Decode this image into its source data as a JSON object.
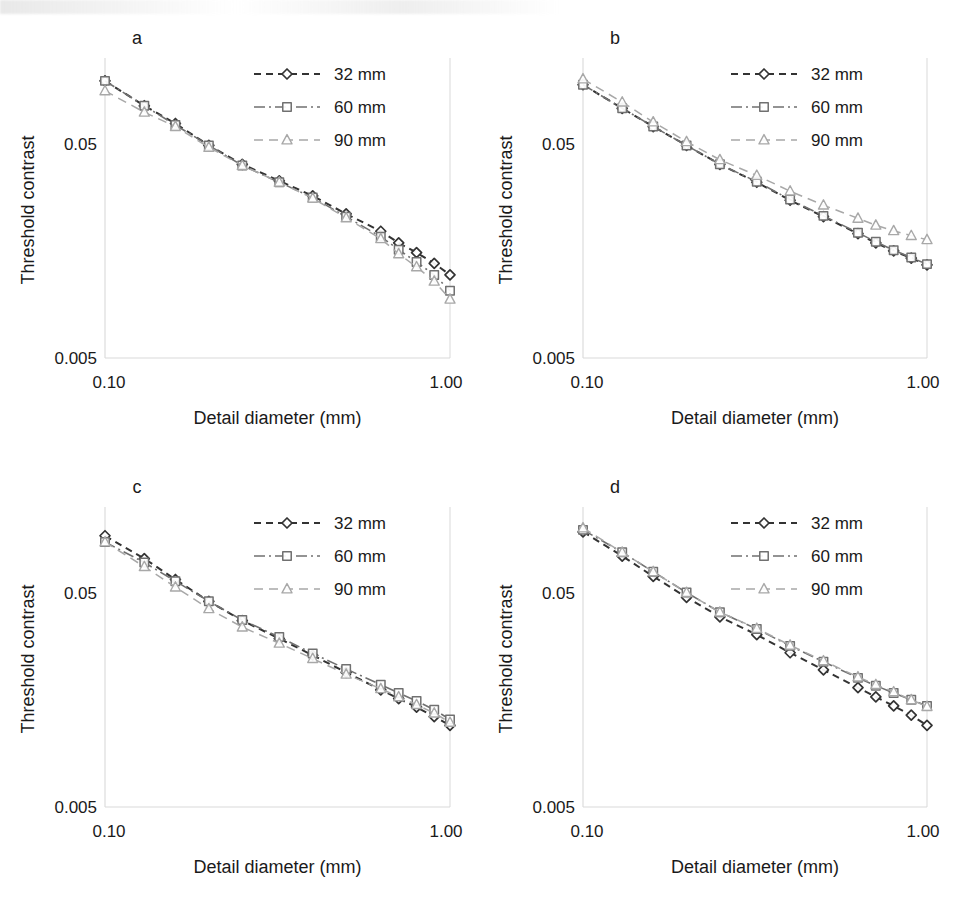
{
  "figure": {
    "panels": [
      {
        "letter": "a",
        "id": "panel-a"
      },
      {
        "letter": "b",
        "id": "panel-b"
      },
      {
        "letter": "c",
        "id": "panel-c"
      },
      {
        "letter": "d",
        "id": "panel-d"
      }
    ],
    "axis": {
      "xlabel": "Detail diameter (mm)",
      "ylabel": "Threshold contrast",
      "xticks": [
        "0.10",
        "1.00"
      ],
      "yticks": [
        "0.05",
        "0.005"
      ]
    },
    "legend": {
      "entries": [
        {
          "label": "32 mm",
          "marker": "diamond",
          "style": "dashed",
          "color": "#333333"
        },
        {
          "label": "60 mm",
          "marker": "square",
          "style": "dashdot",
          "color": "#707070"
        },
        {
          "label": "90 mm",
          "marker": "triangle",
          "style": "dashed",
          "color": "#a8a8a8"
        }
      ]
    },
    "colors": {
      "series_32mm": "#333333",
      "series_60mm": "#707070",
      "series_90mm": "#a8a8a8",
      "gridline": "#d9d9d9",
      "text": "#1a1a1a",
      "background": "#ffffff"
    }
  },
  "chart_data": [
    {
      "type": "line",
      "panel": "a",
      "title": "a",
      "xlabel": "Detail diameter (mm)",
      "ylabel": "Threshold contrast",
      "xscale": "log",
      "yscale": "log",
      "xlim": [
        0.1,
        1.0
      ],
      "ylim": [
        0.005,
        0.12
      ],
      "xticks": [
        0.1,
        1.0
      ],
      "yticks": [
        0.005,
        0.05
      ],
      "grid": false,
      "legend_position": "top-right",
      "x": [
        0.1,
        0.13,
        0.16,
        0.2,
        0.25,
        0.32,
        0.4,
        0.5,
        0.63,
        0.71,
        0.8,
        0.9,
        1.0
      ],
      "series": [
        {
          "name": "32 mm",
          "values": [
            0.098,
            0.075,
            0.062,
            0.049,
            0.04,
            0.0335,
            0.0285,
            0.0235,
            0.0195,
            0.0172,
            0.0155,
            0.0138,
            0.0122
          ]
        },
        {
          "name": "60 mm",
          "values": [
            0.098,
            0.075,
            0.061,
            0.049,
            0.0395,
            0.033,
            0.028,
            0.0228,
            0.0184,
            0.016,
            0.014,
            0.0122,
            0.0103
          ]
        },
        {
          "name": "90 mm",
          "values": [
            0.088,
            0.07,
            0.06,
            0.048,
            0.0395,
            0.033,
            0.0278,
            0.0225,
            0.018,
            0.0153,
            0.0133,
            0.0114,
            0.0094
          ]
        }
      ]
    },
    {
      "type": "line",
      "panel": "b",
      "title": "b",
      "xlabel": "Detail diameter (mm)",
      "ylabel": "Threshold contrast",
      "xscale": "log",
      "yscale": "log",
      "xlim": [
        0.1,
        1.0
      ],
      "ylim": [
        0.005,
        0.12
      ],
      "xticks": [
        0.1,
        1.0
      ],
      "yticks": [
        0.005,
        0.05
      ],
      "grid": false,
      "legend_position": "top-right",
      "x": [
        0.1,
        0.13,
        0.16,
        0.2,
        0.25,
        0.32,
        0.4,
        0.5,
        0.63,
        0.71,
        0.8,
        0.9,
        1.0
      ],
      "series": [
        {
          "name": "32 mm",
          "values": [
            0.094,
            0.073,
            0.06,
            0.049,
            0.04,
            0.033,
            0.0272,
            0.0228,
            0.019,
            0.0172,
            0.0158,
            0.0146,
            0.0136
          ]
        },
        {
          "name": "60 mm",
          "values": [
            0.094,
            0.073,
            0.06,
            0.049,
            0.04,
            0.0332,
            0.0274,
            0.023,
            0.0192,
            0.0174,
            0.0159,
            0.0147,
            0.0137
          ]
        },
        {
          "name": "90 mm",
          "values": [
            0.1,
            0.078,
            0.063,
            0.051,
            0.042,
            0.0355,
            0.03,
            0.0258,
            0.0224,
            0.0208,
            0.0196,
            0.0186,
            0.0178
          ]
        }
      ]
    },
    {
      "type": "line",
      "panel": "c",
      "title": "c",
      "xlabel": "Detail diameter (mm)",
      "ylabel": "Threshold contrast",
      "xscale": "log",
      "yscale": "log",
      "xlim": [
        0.1,
        1.0
      ],
      "ylim": [
        0.005,
        0.12
      ],
      "xticks": [
        0.1,
        1.0
      ],
      "yticks": [
        0.005,
        0.05
      ],
      "grid": false,
      "legend_position": "top-right",
      "x": [
        0.1,
        0.13,
        0.16,
        0.2,
        0.25,
        0.32,
        0.4,
        0.5,
        0.63,
        0.71,
        0.8,
        0.9,
        1.0
      ],
      "series": [
        {
          "name": "32 mm",
          "values": [
            0.092,
            0.072,
            0.0575,
            0.0455,
            0.037,
            0.0305,
            0.0255,
            0.0212,
            0.0176,
            0.016,
            0.0146,
            0.0132,
            0.012
          ]
        },
        {
          "name": "60 mm",
          "values": [
            0.086,
            0.069,
            0.0565,
            0.0455,
            0.0372,
            0.031,
            0.026,
            0.022,
            0.0186,
            0.017,
            0.0156,
            0.0142,
            0.0128
          ]
        },
        {
          "name": "90 mm",
          "values": [
            0.086,
            0.066,
            0.053,
            0.042,
            0.0345,
            0.029,
            0.0246,
            0.0208,
            0.0178,
            0.0163,
            0.015,
            0.0137,
            0.0124
          ]
        }
      ]
    },
    {
      "type": "line",
      "panel": "d",
      "title": "d",
      "xlabel": "Detail diameter (mm)",
      "ylabel": "Threshold contrast",
      "xscale": "log",
      "yscale": "log",
      "xlim": [
        0.1,
        1.0
      ],
      "ylim": [
        0.005,
        0.12
      ],
      "xticks": [
        0.1,
        1.0
      ],
      "yticks": [
        0.005,
        0.05
      ],
      "grid": false,
      "legend_position": "top-right",
      "x": [
        0.1,
        0.13,
        0.16,
        0.2,
        0.25,
        0.32,
        0.4,
        0.5,
        0.63,
        0.71,
        0.8,
        0.9,
        1.0
      ],
      "series": [
        {
          "name": "32 mm",
          "values": [
            0.096,
            0.074,
            0.0595,
            0.0475,
            0.0385,
            0.0318,
            0.0262,
            0.0218,
            0.018,
            0.0163,
            0.0148,
            0.0134,
            0.012
          ]
        },
        {
          "name": "60 mm",
          "values": [
            0.098,
            0.077,
            0.0625,
            0.05,
            0.0405,
            0.0338,
            0.0282,
            0.0238,
            0.02,
            0.0184,
            0.017,
            0.0158,
            0.0148
          ]
        },
        {
          "name": "90 mm",
          "values": [
            0.1,
            0.077,
            0.0625,
            0.05,
            0.0405,
            0.034,
            0.0284,
            0.024,
            0.0202,
            0.0186,
            0.0172,
            0.0158,
            0.0147
          ]
        }
      ]
    }
  ]
}
